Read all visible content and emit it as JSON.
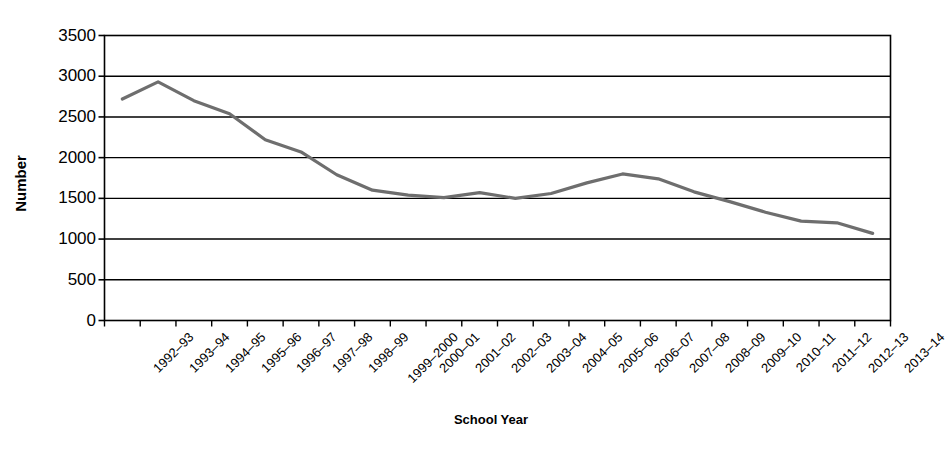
{
  "chart_data": {
    "type": "line",
    "title": "",
    "xlabel": "School Year",
    "ylabel": "Number",
    "ylim": [
      0,
      3500
    ],
    "ytick_values": [
      0,
      500,
      1000,
      1500,
      2000,
      2500,
      3000,
      3500
    ],
    "ytick_labels": [
      "0",
      "500",
      "1000",
      "1500",
      "2000",
      "2500",
      "3000",
      "3500"
    ],
    "grid": "horizontal",
    "legend": "none",
    "series_color": "#6e6e6e",
    "axis_color": "#000000",
    "categories": [
      "1992–93",
      "1993–94",
      "1994–95",
      "1995–96",
      "1996–97",
      "1997–98",
      "1998–99",
      "1999–2000",
      "2000–01",
      "2001–02",
      "2002–03",
      "2003–04",
      "2004–05",
      "2005–06",
      "2006–07",
      "2007–08",
      "2008–09",
      "2009–10",
      "2010–11",
      "2011–12",
      "2012–13",
      "2013–14"
    ],
    "series": [
      {
        "name": "Number",
        "values": [
          2720,
          2930,
          2700,
          2540,
          2220,
          2070,
          1790,
          1600,
          1540,
          1510,
          1570,
          1500,
          1560,
          1690,
          1800,
          1740,
          1580,
          1460,
          1330,
          1220,
          1200,
          1070
        ]
      }
    ]
  }
}
